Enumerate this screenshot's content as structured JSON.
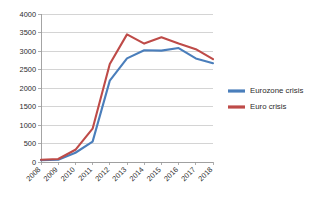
{
  "chart_data": {
    "type": "line",
    "title": "",
    "xlabel": "",
    "ylabel": "",
    "categories": [
      "2008",
      "2009",
      "2010",
      "2011",
      "2012",
      "2013",
      "2014",
      "2015",
      "2016",
      "2017",
      "2018"
    ],
    "ylim": [
      0,
      4000
    ],
    "xlim_categories": [
      "2008",
      "2018"
    ],
    "y_ticks": [
      0,
      500,
      1000,
      1500,
      2000,
      2500,
      3000,
      3500,
      4000
    ],
    "y_tick_labels": [
      "0",
      "500",
      "1000",
      "1500",
      "2000",
      "2500",
      "3000",
      "3500",
      "4000"
    ],
    "grid": "horizontal",
    "legend_position": "right",
    "x_tick_label_rotation": -45,
    "series": [
      {
        "name": "Eurozone crisis",
        "color": "#4A7EBB",
        "values": [
          50,
          60,
          250,
          550,
          2200,
          2800,
          3020,
          3010,
          3080,
          2800,
          2670
        ]
      },
      {
        "name": "Euro crisis",
        "color": "#BE4B48",
        "values": [
          60,
          80,
          330,
          900,
          2650,
          3450,
          3200,
          3370,
          3200,
          3050,
          2780
        ]
      }
    ]
  },
  "legend": {
    "items": [
      {
        "label": "Eurozone crisis",
        "color": "#4A7EBB"
      },
      {
        "label": "Euro crisis",
        "color": "#BE4B48"
      }
    ]
  },
  "axes": {
    "y_tick_labels": [
      "4000",
      "3500",
      "3000",
      "2500",
      "2000",
      "1500",
      "1000",
      "500",
      "0"
    ],
    "x_tick_labels": [
      "2008",
      "2009",
      "2010",
      "2011",
      "2012",
      "2013",
      "2014",
      "2015",
      "2016",
      "2017",
      "2018"
    ]
  },
  "colors": {
    "gridline": "#c9c9c9",
    "axis": "#9a9a9a",
    "text": "#2b2b2b",
    "plot_background": "#ffffff",
    "series_blue": "#4A7EBB",
    "series_red": "#BE4B48"
  }
}
